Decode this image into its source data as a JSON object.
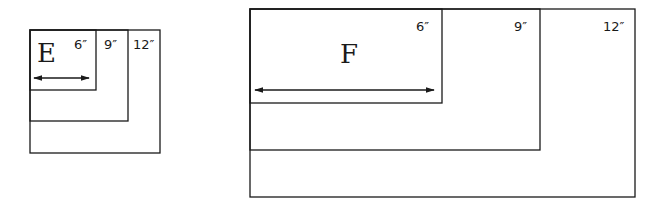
{
  "figure_small": {
    "label": "E",
    "sizes": [
      {
        "label": "6″"
      },
      {
        "label": "9″"
      },
      {
        "label": "12″"
      }
    ]
  },
  "figure_large": {
    "label": "F",
    "sizes": [
      {
        "label": "6″"
      },
      {
        "label": "9″"
      },
      {
        "label": "12″"
      }
    ]
  },
  "colors": {
    "line": "#1a1a1a",
    "background": "#ffffff"
  }
}
